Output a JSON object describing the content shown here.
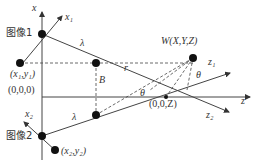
{
  "labels": {
    "x_axis": "x",
    "x1_axis": "x₁",
    "image1": "图像1",
    "image2": "图像2",
    "point1": "(x₁,y₁)",
    "point2": "(x₂,y₂)",
    "origin": "(0,0,0)",
    "lambda_top": "λ",
    "lambda_bottom": "λ",
    "r": "r",
    "B": "B",
    "W": "W(X,Y,Z)",
    "theta_left": "θ",
    "theta_right": "θ",
    "z1_axis": "z₁",
    "z_axis": "z",
    "z2_axis": "z₂",
    "x2_axis": "x₂",
    "zpoint": "(0,0,Z)"
  },
  "colors": {
    "stroke": "#333333",
    "dot": "#111111"
  }
}
